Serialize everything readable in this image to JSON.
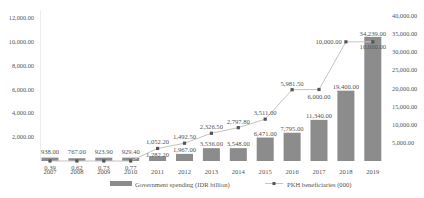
{
  "chart_data": {
    "type": "bar+line",
    "title": "",
    "categories": [
      "2007",
      "2008",
      "2009",
      "2010",
      "2011",
      "2012",
      "2013",
      "2014",
      "2015",
      "2016",
      "2017",
      "2018",
      "2019"
    ],
    "series": [
      {
        "name": "Government spending (IDR billion)",
        "type": "bar",
        "axis": "right",
        "values": [
          938.0,
          767.0,
          923.9,
          929.4,
          1282.2,
          1967.0,
          3536.0,
          3548.0,
          6471.0,
          7795.0,
          11340.0,
          19400.0,
          34239.0
        ],
        "labels": [
          "938.00",
          "767.00",
          "923.90",
          "929.40",
          "1,282.20",
          "1,967.00",
          "3,536.00",
          "3,548.00",
          "6,471.00",
          "7,795.00",
          "11,340.00",
          "19,400.00",
          "34,239.00"
        ],
        "color": "#8c8c8c"
      },
      {
        "name": "PKH beneficiaries (000)",
        "type": "line",
        "axis": "left",
        "values": [
          0.39,
          0.62,
          0.73,
          0.77,
          1052.2,
          1492.5,
          2326.5,
          2797.8,
          3511.0,
          5981.5,
          6000.0,
          10000.0,
          10000.0
        ],
        "labels": [
          "0.39",
          "0.62",
          "0.73",
          "0.77",
          "1,052.20",
          "1,492.50",
          "2,326.50",
          "2,797.80",
          "3,511.00",
          "5,981.50",
          "6,000.00",
          "10,000.00",
          "10,000.00"
        ],
        "color": "#c4c4c4",
        "marker_color": "#555555"
      }
    ],
    "left_axis": {
      "ylim": [
        0,
        12000
      ],
      "ticks": [
        "2,000.00",
        "4,000.00",
        "6,000.00",
        "8,000.00",
        "10,000.00",
        "12,000.00"
      ],
      "tick_values": [
        2000,
        4000,
        6000,
        8000,
        10000,
        12000
      ]
    },
    "right_axis": {
      "ylim": [
        0,
        40000
      ],
      "ticks": [
        "5,000.00",
        "10,000.00",
        "15,000.00",
        "20,000.00",
        "25,000.00",
        "30,000.00",
        "35,000.00",
        "40,000.00"
      ],
      "tick_values": [
        5000,
        10000,
        15000,
        20000,
        25000,
        30000,
        35000,
        40000
      ]
    },
    "xlabel": "",
    "ylabel": "",
    "grid": false,
    "legend": {
      "position": "bottom",
      "entries": [
        "Government spending (IDR billion)",
        "PKH beneficiaries (000)"
      ]
    }
  }
}
